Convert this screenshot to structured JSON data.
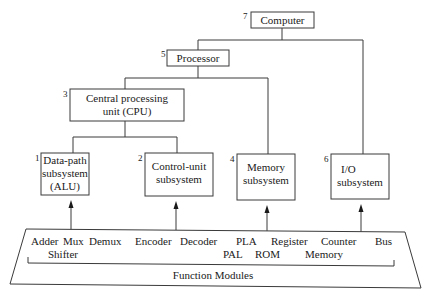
{
  "diagram": {
    "type": "hierarchy",
    "nodes": [
      {
        "id": "computer",
        "number": "7",
        "lines": [
          "Computer"
        ]
      },
      {
        "id": "processor",
        "number": "5",
        "lines": [
          "Processor"
        ]
      },
      {
        "id": "cpu",
        "number": "3",
        "lines": [
          "Central processing",
          "unit (CPU)"
        ]
      },
      {
        "id": "datapath",
        "number": "1",
        "lines": [
          "Data-path",
          "subsystem",
          "(ALU)"
        ]
      },
      {
        "id": "controlunit",
        "number": "2",
        "lines": [
          "Control-unit",
          "subsystem"
        ]
      },
      {
        "id": "memory",
        "number": "4",
        "lines": [
          "Memory",
          "subsystem"
        ]
      },
      {
        "id": "io",
        "number": "6",
        "lines": [
          "I/O",
          "subsystem"
        ]
      }
    ],
    "edges": [
      {
        "from": "computer",
        "to": "processor"
      },
      {
        "from": "computer",
        "to": "io"
      },
      {
        "from": "processor",
        "to": "cpu"
      },
      {
        "from": "processor",
        "to": "memory"
      },
      {
        "from": "cpu",
        "to": "datapath"
      },
      {
        "from": "cpu",
        "to": "controlunit"
      }
    ],
    "function_modules": {
      "title": "Function Modules",
      "row1": [
        "Adder",
        "Mux",
        "Demux",
        "Encoder",
        "Decoder",
        "PLA",
        "Register",
        "Counter",
        "Bus"
      ],
      "row2": [
        "Shifter",
        "PAL",
        "ROM",
        "Memory"
      ],
      "arrows_to": [
        "datapath",
        "controlunit",
        "memory",
        "io"
      ]
    }
  }
}
